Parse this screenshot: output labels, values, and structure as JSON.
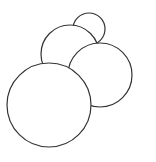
{
  "diagram": {
    "width": 156,
    "height": 162,
    "background": "#ffffff",
    "stroke": "#333333",
    "fill": "#ffffff",
    "stroke_width": 1.2,
    "circles": [
      {
        "name": "circle-small-top",
        "cx": 89,
        "cy": 29,
        "r": 16
      },
      {
        "name": "circle-middle-left",
        "cx": 70,
        "cy": 54,
        "r": 29
      },
      {
        "name": "circle-right",
        "cx": 100,
        "cy": 75,
        "r": 32
      },
      {
        "name": "circle-large-front",
        "cx": 49,
        "cy": 105,
        "r": 42
      }
    ]
  }
}
